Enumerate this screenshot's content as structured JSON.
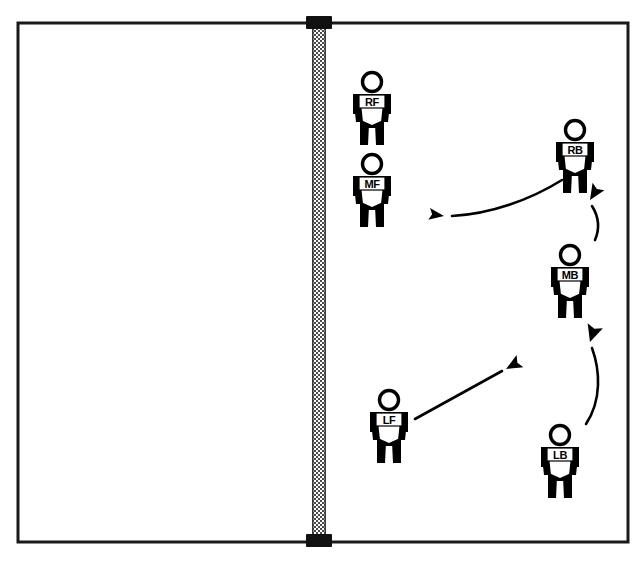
{
  "diagram": {
    "type": "volleyball-court-rotation-diagram",
    "court": {
      "x": 18,
      "y": 23,
      "width": 610,
      "height": 519,
      "border_color": "#1a1a1a",
      "border_width": 3,
      "fill_color": "#ffffff"
    },
    "net": {
      "name": "volleyball-net",
      "x": 312,
      "y": 23,
      "width": 14,
      "height": 519,
      "mesh_color": "#555555",
      "cap_color": "#111111",
      "cap_width": 26,
      "cap_height": 13
    },
    "players": [
      {
        "id": "RF",
        "label": "RF",
        "name": "player-right-front",
        "side": "left",
        "x": 372,
        "y": 112,
        "scale": 1.0
      },
      {
        "id": "MF",
        "label": "MF",
        "name": "player-middle-front",
        "side": "left",
        "x": 372,
        "y": 194,
        "scale": 1.0
      },
      {
        "id": "RB",
        "label": "RB",
        "name": "player-right-back",
        "side": "right",
        "x": 575,
        "y": 160,
        "scale": 1.0
      },
      {
        "id": "MB",
        "label": "MB",
        "name": "player-middle-back",
        "side": "right",
        "x": 570,
        "y": 285,
        "scale": 1.0
      },
      {
        "id": "LF",
        "label": "LF",
        "name": "player-left-front",
        "side": "right",
        "x": 389,
        "y": 430,
        "scale": 1.0
      },
      {
        "id": "LB",
        "label": "LB",
        "name": "player-left-back",
        "side": "right",
        "x": 560,
        "y": 465,
        "scale": 1.0
      }
    ],
    "arrows": [
      {
        "id": "rb-to-left",
        "name": "arrow-rb-moves-left",
        "style": "curved",
        "path": "M 562 180 C 530 200 490 214 452 216",
        "arrow_at": "end",
        "head_angle": 188,
        "head_x": 444,
        "head_y": 216
      },
      {
        "id": "mb-to-rb",
        "name": "arrow-mb-moves-up-to-rb",
        "style": "curved",
        "path": "M 595 240 C 601 226 597 214 592 206",
        "arrow_at": "end",
        "head_angle": -58,
        "head_x": 590,
        "head_y": 200
      },
      {
        "id": "lf-to-upright",
        "name": "arrow-lf-moves-up-right",
        "style": "straight",
        "path": "M 415 419 L 502 371",
        "arrow_at": "end",
        "head_angle": -29,
        "head_x": 506,
        "head_y": 369
      },
      {
        "id": "lb-to-mb",
        "name": "arrow-lb-moves-up-to-mb",
        "style": "curved",
        "path": "M 586 424 C 602 400 600 370 592 348",
        "arrow_at": "end",
        "head_angle": -72,
        "head_x": 590,
        "head_y": 342
      }
    ],
    "colors": {
      "ink": "#000000",
      "court_line": "#1a1a1a",
      "net_mesh": "#555555",
      "background": "#ffffff"
    }
  }
}
